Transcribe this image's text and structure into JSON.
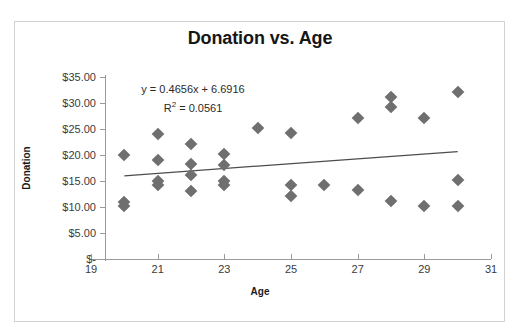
{
  "chart_data": {
    "type": "scatter",
    "title": "Donation vs. Age",
    "xlabel": "Age",
    "ylabel": "Donation",
    "xlim": [
      19,
      31
    ],
    "ylim": [
      0,
      35
    ],
    "xticks": [
      19,
      21,
      23,
      25,
      27,
      29,
      31
    ],
    "xtick_labels": [
      "19",
      "21",
      "23",
      "25",
      "27",
      "29",
      "31"
    ],
    "yticks": [
      0,
      5,
      10,
      15,
      20,
      25,
      30,
      35
    ],
    "ytick_labels": [
      "$-",
      "$5.00",
      "$10.00",
      "$15.00",
      "$20.00",
      "$25.00",
      "$30.00",
      "$35.00"
    ],
    "grid": false,
    "legend": false,
    "marker_color": "#6f6f6f",
    "marker_shape": "diamond",
    "points": [
      {
        "x": 20,
        "y": 20.0
      },
      {
        "x": 20,
        "y": 11.0
      },
      {
        "x": 20,
        "y": 10.2
      },
      {
        "x": 21,
        "y": 24.0
      },
      {
        "x": 21,
        "y": 19.0
      },
      {
        "x": 21,
        "y": 15.0
      },
      {
        "x": 21,
        "y": 14.2
      },
      {
        "x": 22,
        "y": 22.2
      },
      {
        "x": 22,
        "y": 18.2
      },
      {
        "x": 22,
        "y": 16.1
      },
      {
        "x": 22,
        "y": 13.0
      },
      {
        "x": 23,
        "y": 20.2
      },
      {
        "x": 23,
        "y": 18.0
      },
      {
        "x": 23,
        "y": 15.0
      },
      {
        "x": 23,
        "y": 14.2
      },
      {
        "x": 24,
        "y": 25.1
      },
      {
        "x": 25,
        "y": 24.2
      },
      {
        "x": 25,
        "y": 14.2
      },
      {
        "x": 25,
        "y": 12.2
      },
      {
        "x": 26,
        "y": 14.2
      },
      {
        "x": 27,
        "y": 27.1
      },
      {
        "x": 27,
        "y": 13.2
      },
      {
        "x": 28,
        "y": 31.2
      },
      {
        "x": 28,
        "y": 29.2
      },
      {
        "x": 28,
        "y": 11.2
      },
      {
        "x": 29,
        "y": 27.1
      },
      {
        "x": 29,
        "y": 10.2
      },
      {
        "x": 30,
        "y": 32.2
      },
      {
        "x": 30,
        "y": 15.2
      },
      {
        "x": 30,
        "y": 10.2
      }
    ],
    "trendline": {
      "equation_label": "y = 0.4656x + 6.6916",
      "r2_label_prefix": "R",
      "r2_label_suffix": " = 0.0561",
      "slope": 0.4656,
      "intercept": 6.6916,
      "r_squared": 0.0561,
      "x_start": 20,
      "x_end": 30,
      "color": "#4d4d4d"
    }
  }
}
